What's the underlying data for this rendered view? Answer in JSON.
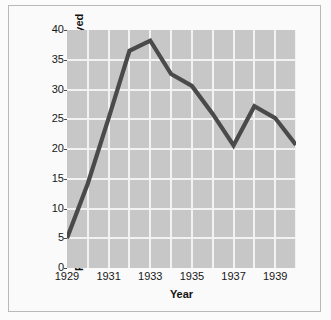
{
  "chart_data": {
    "type": "line",
    "title": "",
    "xlabel": "Year",
    "ylabel": "Percent of non-agricultutral workers unemployed",
    "x": [
      1929,
      1930,
      1931,
      1932,
      1933,
      1934,
      1935,
      1936,
      1937,
      1938,
      1939,
      1940
    ],
    "values": [
      5.0,
      14.2,
      25.2,
      36.5,
      38.2,
      32.6,
      30.6,
      25.9,
      20.6,
      27.2,
      25.2,
      20.7
    ],
    "series": [
      {
        "name": "Percent of non-agricultutral workers unemployed",
        "values": [
          5.0,
          14.2,
          25.2,
          36.5,
          38.2,
          32.6,
          30.6,
          25.9,
          20.6,
          27.2,
          25.2,
          20.7
        ]
      }
    ],
    "xlim": [
      1929,
      1940
    ],
    "ylim": [
      0,
      40
    ],
    "ytick_labels": [
      "0",
      "5",
      "10",
      "15",
      "20",
      "25",
      "30",
      "35",
      "40"
    ],
    "ytick_values": [
      0,
      5,
      10,
      15,
      20,
      25,
      30,
      35,
      40
    ],
    "xtick_labels": [
      "1929",
      "1931",
      "1933",
      "1935",
      "1937",
      "1939"
    ],
    "xtick_values": [
      1929,
      1931,
      1933,
      1935,
      1937,
      1939
    ],
    "grid": true,
    "legend": false,
    "line_color": "#4a4a4a",
    "plot_background": "#c7c7c7",
    "gridline_color": "#f2f2f2",
    "figure_background": "#fafafa"
  }
}
